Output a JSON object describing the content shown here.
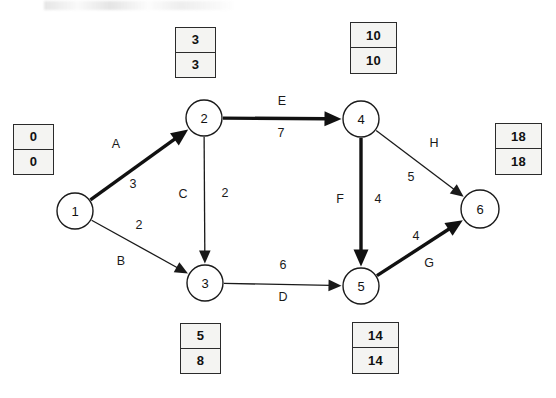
{
  "diagram": {
    "nodes": [
      {
        "id": "1",
        "label": "1",
        "cx": 75,
        "cy": 211,
        "r": 18
      },
      {
        "id": "2",
        "label": "2",
        "cx": 204,
        "cy": 118,
        "r": 18
      },
      {
        "id": "3",
        "label": "3",
        "cx": 205,
        "cy": 283,
        "r": 18
      },
      {
        "id": "4",
        "label": "4",
        "cx": 361,
        "cy": 119,
        "r": 18
      },
      {
        "id": "5",
        "label": "5",
        "cx": 361,
        "cy": 286,
        "r": 18
      },
      {
        "id": "6",
        "label": "6",
        "cx": 480,
        "cy": 209,
        "r": 19
      }
    ],
    "edges": [
      {
        "id": "A",
        "from": "1",
        "to": "2",
        "activity": "A",
        "duration": "3",
        "critical": true,
        "activity_x": 116,
        "activity_y": 144,
        "duration_x": 133,
        "duration_y": 184
      },
      {
        "id": "B",
        "from": "1",
        "to": "3",
        "activity": "B",
        "duration": "2",
        "critical": false,
        "activity_x": 121,
        "activity_y": 261,
        "duration_x": 139,
        "duration_y": 225
      },
      {
        "id": "C",
        "from": "2",
        "to": "3",
        "activity": "C",
        "duration": "2",
        "critical": false,
        "activity_x": 183,
        "activity_y": 194,
        "duration_x": 225,
        "duration_y": 193
      },
      {
        "id": "D",
        "from": "3",
        "to": "5",
        "activity": "D",
        "duration": "6",
        "critical": false,
        "activity_x": 283,
        "activity_y": 297,
        "duration_x": 283,
        "duration_y": 265
      },
      {
        "id": "E",
        "from": "2",
        "to": "4",
        "activity": "E",
        "duration": "7",
        "critical": true,
        "activity_x": 282,
        "activity_y": 101,
        "duration_x": 281,
        "duration_y": 133
      },
      {
        "id": "F",
        "from": "4",
        "to": "5",
        "activity": "F",
        "duration": "4",
        "critical": true,
        "activity_x": 340,
        "activity_y": 199,
        "duration_x": 378,
        "duration_y": 199
      },
      {
        "id": "G",
        "from": "5",
        "to": "6",
        "activity": "G",
        "duration": "4",
        "critical": true,
        "activity_x": 429,
        "activity_y": 263,
        "duration_x": 416,
        "duration_y": 236
      },
      {
        "id": "H",
        "from": "4",
        "to": "6",
        "activity": "H",
        "duration": "5",
        "critical": false,
        "activity_x": 434,
        "activity_y": 143,
        "duration_x": 411,
        "duration_y": 177
      }
    ],
    "time_boxes": [
      {
        "node": "1",
        "earliest": "0",
        "latest": "0",
        "x": 13,
        "y": 124,
        "w": 41,
        "h": 51
      },
      {
        "node": "2",
        "earliest": "3",
        "latest": "3",
        "x": 175,
        "y": 27,
        "w": 41,
        "h": 51
      },
      {
        "node": "3",
        "earliest": "5",
        "latest": "8",
        "x": 180,
        "y": 323,
        "w": 41,
        "h": 51
      },
      {
        "node": "4",
        "earliest": "10",
        "latest": "10",
        "x": 350,
        "y": 22,
        "w": 47,
        "h": 52
      },
      {
        "node": "5",
        "earliest": "14",
        "latest": "14",
        "x": 352,
        "y": 322,
        "w": 47,
        "h": 52
      },
      {
        "node": "6",
        "earliest": "18",
        "latest": "18",
        "x": 495,
        "y": 123,
        "w": 47,
        "h": 52
      }
    ],
    "colors": {
      "stroke": "#1a1a1a",
      "critical_stroke": "#111111",
      "box_fill": "#f4f4f2",
      "box_border": "#2b2b2b",
      "background": "#ffffff"
    }
  }
}
